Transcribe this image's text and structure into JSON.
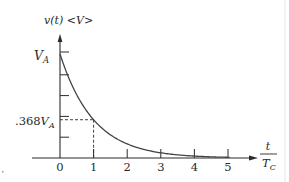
{
  "chart_data": {
    "type": "line",
    "title": "",
    "ylabel": "v(t) <V>",
    "xlabel_num": "t",
    "xlabel_den": "T_C",
    "xlabel": "t / T_C",
    "x_ticks": [
      0,
      1,
      2,
      3,
      4,
      5
    ],
    "x_tick_labels": [
      "0",
      "1",
      "2",
      "3",
      "4",
      "5"
    ],
    "y_ticks_fraction_of_VA": [
      0.2,
      0.4,
      0.6,
      0.8,
      1.0
    ],
    "y_labels": [
      {
        "text": ".368",
        "sub": "A",
        "base": "V",
        "value_fraction_of_VA": 0.368
      },
      {
        "text": "",
        "sub": "A",
        "base": "V",
        "value_fraction_of_VA": 1.0
      }
    ],
    "xlim": [
      0,
      5.8
    ],
    "ylim": [
      0,
      1.35
    ],
    "grid": false,
    "legend": null,
    "series": [
      {
        "name": "v(t) = V_A e^(-t/T_C)",
        "formula": "exp(-x)",
        "x": [
          0,
          0.25,
          0.5,
          0.75,
          1,
          1.5,
          2,
          2.5,
          3,
          3.5,
          4,
          4.5,
          5
        ],
        "values": [
          1.0,
          0.779,
          0.607,
          0.472,
          0.368,
          0.223,
          0.135,
          0.082,
          0.05,
          0.03,
          0.018,
          0.011,
          0.007
        ]
      }
    ],
    "annotations": [
      {
        "type": "dashed-guide",
        "at_x": 1,
        "at_y_fraction": 0.368,
        "text": ".368V_A"
      }
    ]
  },
  "labels": {
    "y_axis_title": "v(t) <V>",
    "va_base": "V",
    "va_sub": "A",
    "k368_prefix": ".368",
    "k368_base": "V",
    "k368_sub": "A",
    "x_num": "t",
    "x_den_base": "T",
    "x_den_sub": "C",
    "ticks": [
      "0",
      "1",
      "2",
      "3",
      "4",
      "5"
    ]
  },
  "colors": {
    "ink": "#2a2a2a",
    "curve": "#444444"
  }
}
